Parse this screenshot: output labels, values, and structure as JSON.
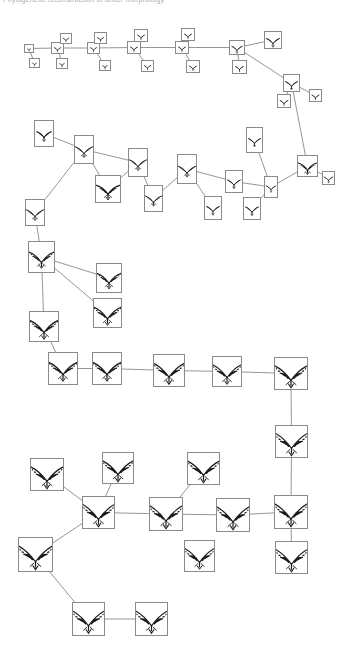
{
  "header": {
    "title_fragment": "Phylogenetic reconstruction of antler morphology"
  },
  "figure": {
    "type": "phylogenetic-tree",
    "node_count": 62,
    "edge_count": 61,
    "line_color": "#8a8a8a",
    "box_border_color": "#8a8a8a",
    "glyph_color": "#1a1a1a",
    "background": "#ffffff"
  },
  "chart_data": {
    "type": "diagram",
    "title": "Phylogenetic reconstruction of antler morphology",
    "xlabel": "",
    "ylabel": "",
    "legend": [],
    "nodes": [
      {
        "id": "n1",
        "x": 24,
        "y": 44,
        "w": 10,
        "h": 9,
        "tines": 1,
        "scale": 0.3
      },
      {
        "id": "n2",
        "x": 29,
        "y": 58,
        "w": 11,
        "h": 10,
        "tines": 1,
        "scale": 0.32
      },
      {
        "id": "n3",
        "x": 51,
        "y": 42,
        "w": 13,
        "h": 12,
        "tines": 2,
        "scale": 0.36
      },
      {
        "id": "n4",
        "x": 60,
        "y": 33,
        "w": 12,
        "h": 11,
        "tines": 2,
        "scale": 0.34
      },
      {
        "id": "n5",
        "x": 56,
        "y": 58,
        "w": 12,
        "h": 11,
        "tines": 1,
        "scale": 0.33
      },
      {
        "id": "n6",
        "x": 87,
        "y": 42,
        "w": 13,
        "h": 12,
        "tines": 2,
        "scale": 0.36
      },
      {
        "id": "n7",
        "x": 94,
        "y": 32,
        "w": 13,
        "h": 12,
        "tines": 2,
        "scale": 0.36
      },
      {
        "id": "n8",
        "x": 99,
        "y": 60,
        "w": 12,
        "h": 11,
        "tines": 1,
        "scale": 0.33
      },
      {
        "id": "n9",
        "x": 127,
        "y": 41,
        "w": 14,
        "h": 13,
        "tines": 2,
        "scale": 0.4
      },
      {
        "id": "n10",
        "x": 134,
        "y": 29,
        "w": 14,
        "h": 13,
        "tines": 2,
        "scale": 0.4
      },
      {
        "id": "n11",
        "x": 141,
        "y": 60,
        "w": 13,
        "h": 12,
        "tines": 2,
        "scale": 0.38
      },
      {
        "id": "n12",
        "x": 175,
        "y": 41,
        "w": 14,
        "h": 13,
        "tines": 2,
        "scale": 0.41
      },
      {
        "id": "n13",
        "x": 181,
        "y": 28,
        "w": 14,
        "h": 13,
        "tines": 2,
        "scale": 0.41
      },
      {
        "id": "n14",
        "x": 186,
        "y": 60,
        "w": 14,
        "h": 13,
        "tines": 2,
        "scale": 0.4
      },
      {
        "id": "n15",
        "x": 229,
        "y": 40,
        "w": 16,
        "h": 15,
        "tines": 3,
        "scale": 0.46
      },
      {
        "id": "n16",
        "x": 232,
        "y": 60,
        "w": 15,
        "h": 14,
        "tines": 2,
        "scale": 0.43
      },
      {
        "id": "n17",
        "x": 264,
        "y": 31,
        "w": 18,
        "h": 18,
        "tines": 3,
        "scale": 0.52
      },
      {
        "id": "n18",
        "x": 283,
        "y": 74,
        "w": 17,
        "h": 18,
        "tines": 3,
        "scale": 0.52
      },
      {
        "id": "n19",
        "x": 277,
        "y": 94,
        "w": 14,
        "h": 14,
        "tines": 2,
        "scale": 0.42
      },
      {
        "id": "n20",
        "x": 309,
        "y": 89,
        "w": 13,
        "h": 13,
        "tines": 2,
        "scale": 0.4
      },
      {
        "id": "n21",
        "x": 34,
        "y": 120,
        "w": 20,
        "h": 27,
        "tines": 3,
        "scale": 0.72
      },
      {
        "id": "n22",
        "x": 74,
        "y": 135,
        "w": 20,
        "h": 29,
        "tines": 4,
        "scale": 0.78
      },
      {
        "id": "n23",
        "x": 25,
        "y": 199,
        "w": 20,
        "h": 27,
        "tines": 4,
        "scale": 0.74
      },
      {
        "id": "n24",
        "x": 95,
        "y": 175,
        "w": 26,
        "h": 28,
        "tines": 4,
        "scale": 0.8
      },
      {
        "id": "n25",
        "x": 128,
        "y": 148,
        "w": 20,
        "h": 29,
        "tines": 4,
        "scale": 0.8
      },
      {
        "id": "n26",
        "x": 144,
        "y": 185,
        "w": 19,
        "h": 27,
        "tines": 4,
        "scale": 0.76
      },
      {
        "id": "n27",
        "x": 177,
        "y": 154,
        "w": 20,
        "h": 30,
        "tines": 4,
        "scale": 0.82
      },
      {
        "id": "n28",
        "x": 225,
        "y": 170,
        "w": 18,
        "h": 23,
        "tines": 3,
        "scale": 0.66
      },
      {
        "id": "n29",
        "x": 204,
        "y": 196,
        "w": 18,
        "h": 24,
        "tines": 3,
        "scale": 0.66
      },
      {
        "id": "n30",
        "x": 246,
        "y": 127,
        "w": 17,
        "h": 26,
        "tines": 3,
        "scale": 0.68
      },
      {
        "id": "n31",
        "x": 264,
        "y": 176,
        "w": 14,
        "h": 22,
        "tines": 3,
        "scale": 0.6
      },
      {
        "id": "n32",
        "x": 243,
        "y": 197,
        "w": 18,
        "h": 23,
        "tines": 3,
        "scale": 0.64
      },
      {
        "id": "n33",
        "x": 297,
        "y": 155,
        "w": 21,
        "h": 22,
        "tines": 4,
        "scale": 0.66
      },
      {
        "id": "n34",
        "x": 322,
        "y": 171,
        "w": 13,
        "h": 14,
        "tines": 3,
        "scale": 0.46
      },
      {
        "id": "n35",
        "x": 28,
        "y": 241,
        "w": 27,
        "h": 32,
        "tines": 5,
        "scale": 0.9
      },
      {
        "id": "n36",
        "x": 96,
        "y": 263,
        "w": 26,
        "h": 30,
        "tines": 5,
        "scale": 0.86
      },
      {
        "id": "n37",
        "x": 93,
        "y": 298,
        "w": 29,
        "h": 30,
        "tines": 6,
        "scale": 0.9
      },
      {
        "id": "n38",
        "x": 29,
        "y": 311,
        "w": 30,
        "h": 31,
        "tines": 6,
        "scale": 0.92
      },
      {
        "id": "n39",
        "x": 48,
        "y": 352,
        "w": 30,
        "h": 33,
        "tines": 6,
        "scale": 0.95
      },
      {
        "id": "n40",
        "x": 92,
        "y": 352,
        "w": 30,
        "h": 33,
        "tines": 6,
        "scale": 0.96
      },
      {
        "id": "n41",
        "x": 153,
        "y": 354,
        "w": 32,
        "h": 33,
        "tines": 7,
        "scale": 0.98
      },
      {
        "id": "n42",
        "x": 212,
        "y": 356,
        "w": 30,
        "h": 31,
        "tines": 7,
        "scale": 0.96
      },
      {
        "id": "n43",
        "x": 274,
        "y": 357,
        "w": 34,
        "h": 33,
        "tines": 7,
        "scale": 1.0
      },
      {
        "id": "n44",
        "x": 275,
        "y": 425,
        "w": 33,
        "h": 33,
        "tines": 8,
        "scale": 1.02
      },
      {
        "id": "n45",
        "x": 274,
        "y": 495,
        "w": 34,
        "h": 34,
        "tines": 8,
        "scale": 1.04
      },
      {
        "id": "n46",
        "x": 275,
        "y": 541,
        "w": 33,
        "h": 33,
        "tines": 8,
        "scale": 1.02
      },
      {
        "id": "n47",
        "x": 30,
        "y": 458,
        "w": 34,
        "h": 33,
        "tines": 7,
        "scale": 1.0
      },
      {
        "id": "n48",
        "x": 102,
        "y": 452,
        "w": 32,
        "h": 32,
        "tines": 7,
        "scale": 0.98
      },
      {
        "id": "n49",
        "x": 82,
        "y": 496,
        "w": 33,
        "h": 33,
        "tines": 8,
        "scale": 1.02
      },
      {
        "id": "n50",
        "x": 149,
        "y": 497,
        "w": 34,
        "h": 34,
        "tines": 8,
        "scale": 1.04
      },
      {
        "id": "n51",
        "x": 187,
        "y": 452,
        "w": 33,
        "h": 33,
        "tines": 7,
        "scale": 1.0
      },
      {
        "id": "n52",
        "x": 216,
        "y": 498,
        "w": 34,
        "h": 34,
        "tines": 8,
        "scale": 1.04
      },
      {
        "id": "n53",
        "x": 184,
        "y": 540,
        "w": 31,
        "h": 32,
        "tines": 8,
        "scale": 0.98
      },
      {
        "id": "n54",
        "x": 18,
        "y": 537,
        "w": 35,
        "h": 35,
        "tines": 8,
        "scale": 1.06
      },
      {
        "id": "n55",
        "x": 72,
        "y": 602,
        "w": 33,
        "h": 34,
        "tines": 8,
        "scale": 1.02
      },
      {
        "id": "n56",
        "x": 135,
        "y": 602,
        "w": 33,
        "h": 34,
        "tines": 8,
        "scale": 1.02
      }
    ],
    "edges": [
      [
        "n1",
        "n3"
      ],
      [
        "n3",
        "n4"
      ],
      [
        "n3",
        "n5"
      ],
      [
        "n3",
        "n6"
      ],
      [
        "n6",
        "n7"
      ],
      [
        "n6",
        "n8"
      ],
      [
        "n6",
        "n9"
      ],
      [
        "n9",
        "n10"
      ],
      [
        "n9",
        "n11"
      ],
      [
        "n9",
        "n12"
      ],
      [
        "n12",
        "n13"
      ],
      [
        "n12",
        "n14"
      ],
      [
        "n12",
        "n15"
      ],
      [
        "n15",
        "n16"
      ],
      [
        "n15",
        "n17"
      ],
      [
        "n15",
        "n18"
      ],
      [
        "n18",
        "n19"
      ],
      [
        "n18",
        "n20"
      ],
      [
        "n18",
        "n33"
      ],
      [
        "n21",
        "n22"
      ],
      [
        "n22",
        "n23"
      ],
      [
        "n22",
        "n24"
      ],
      [
        "n22",
        "n25"
      ],
      [
        "n25",
        "n24"
      ],
      [
        "n25",
        "n26"
      ],
      [
        "n26",
        "n27"
      ],
      [
        "n27",
        "n29"
      ],
      [
        "n27",
        "n28"
      ],
      [
        "n28",
        "n31"
      ],
      [
        "n31",
        "n30"
      ],
      [
        "n31",
        "n32"
      ],
      [
        "n31",
        "n33"
      ],
      [
        "n33",
        "n34"
      ],
      [
        "n23",
        "n35"
      ],
      [
        "n35",
        "n36"
      ],
      [
        "n35",
        "n37"
      ],
      [
        "n35",
        "n38"
      ],
      [
        "n38",
        "n39"
      ],
      [
        "n39",
        "n40"
      ],
      [
        "n40",
        "n41"
      ],
      [
        "n41",
        "n42"
      ],
      [
        "n42",
        "n43"
      ],
      [
        "n43",
        "n44"
      ],
      [
        "n44",
        "n45"
      ],
      [
        "n45",
        "n46"
      ],
      [
        "n45",
        "n52"
      ],
      [
        "n47",
        "n49"
      ],
      [
        "n48",
        "n49"
      ],
      [
        "n49",
        "n50"
      ],
      [
        "n49",
        "n54"
      ],
      [
        "n50",
        "n51"
      ],
      [
        "n50",
        "n52"
      ],
      [
        "n54",
        "n55"
      ],
      [
        "n55",
        "n56"
      ],
      [
        "n2",
        "n1"
      ]
    ]
  }
}
